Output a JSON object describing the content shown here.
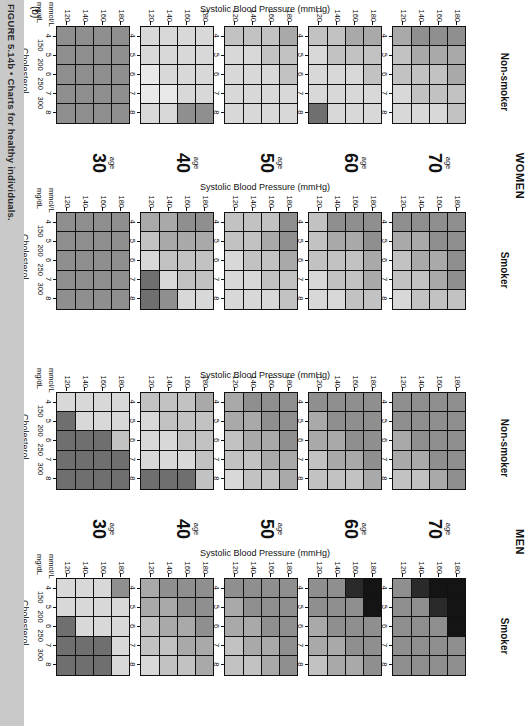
{
  "figure": {
    "caption": "FIGURE 5.14b • Charts for healthy individuals.",
    "panel_letter": "(b)",
    "caption_band_color": "#c9c9c9"
  },
  "axes": {
    "x_title": "Cholesterol",
    "y_title": "Systolic Blood Pressure (mmHg)",
    "bp_ticks": [
      "180",
      "160",
      "140",
      "120"
    ],
    "chol_mmol_ticks": [
      "4",
      "5",
      "6",
      "7",
      "8"
    ],
    "chol_mgdl_ticks": [
      "150",
      "200",
      "250",
      "300"
    ],
    "unit_mmol": "mmol/L",
    "unit_mgdl": "mg/dL"
  },
  "legend_palette": {
    "l1": "#e9e9e9",
    "l2": "#d8d8d8",
    "l3": "#c2c2c2",
    "l4": "#a9a9a9",
    "l5": "#8f8f8f",
    "l6": "#6f6f6f",
    "l7": "#4a4a4a",
    "l8": "#2a2a2a",
    "l9": "#141414"
  },
  "blocks": [
    {
      "id": "women",
      "title": "WOMEN",
      "columns": [
        {
          "id": "women-nonsmoker",
          "label": "Non-smoker"
        },
        {
          "id": "women-smoker",
          "label": "Smoker"
        }
      ],
      "ages": [
        "70",
        "60",
        "50",
        "40",
        "30"
      ],
      "age_word": "age"
    },
    {
      "id": "men",
      "title": "MEN",
      "columns": [
        {
          "id": "men-nonsmoker",
          "label": "Non-smoker"
        },
        {
          "id": "men-smoker",
          "label": "Smoker"
        }
      ],
      "ages": [
        "70",
        "60",
        "50",
        "40",
        "30"
      ],
      "age_word": "age"
    }
  ],
  "chart_data": {
    "type": "heatmap",
    "xlabel": "Cholesterol",
    "ylabel": "Systolic Blood Pressure (mmHg)",
    "x_categories_mmol": [
      "4",
      "5",
      "6",
      "7",
      "8"
    ],
    "x_categories_mgdl": [
      "150",
      "200",
      "250",
      "300"
    ],
    "y_categories": [
      "180",
      "160",
      "140",
      "120"
    ],
    "grid": true,
    "legend_position": "none",
    "note": "Each panel is a 4-row (systolic BP 180,160,140,120 top to bottom) x 5-column (cholesterol 4..8 mmol/L left to right) grid of greyscale risk cells. Values below are greyscale levels 1 (lightest / lowest risk) to 9 (darkest / highest risk) read off the printed shading.",
    "panels": [
      {
        "sex": "WOMEN",
        "smoking": "Non-smoker",
        "age": "70",
        "values": [
          [
            5,
            5,
            5,
            4
          ],
          [
            4,
            4,
            4,
            3
          ],
          [
            4,
            3,
            3,
            3
          ],
          [
            3,
            3,
            3,
            2
          ],
          [
            3,
            2,
            2,
            2
          ]
        ]
      },
      {
        "sex": "WOMEN",
        "smoking": "Non-smoker",
        "age": "60",
        "values": [
          [
            4,
            4,
            3,
            3
          ],
          [
            3,
            3,
            3,
            2
          ],
          [
            3,
            2,
            2,
            2
          ],
          [
            2,
            2,
            2,
            2
          ],
          [
            2,
            2,
            2,
            6
          ]
        ]
      },
      {
        "sex": "WOMEN",
        "smoking": "Non-smoker",
        "age": "50",
        "values": [
          [
            4,
            3,
            3,
            3
          ],
          [
            3,
            3,
            2,
            2
          ],
          [
            3,
            2,
            2,
            2
          ],
          [
            2,
            2,
            2,
            2
          ],
          [
            2,
            2,
            2,
            2
          ]
        ]
      },
      {
        "sex": "WOMEN",
        "smoking": "Non-smoker",
        "age": "40",
        "values": [
          [
            2,
            2,
            2,
            2
          ],
          [
            2,
            2,
            2,
            2
          ],
          [
            2,
            2,
            2,
            1
          ],
          [
            2,
            2,
            1,
            1
          ],
          [
            5,
            5,
            2,
            2
          ]
        ]
      },
      {
        "sex": "WOMEN",
        "smoking": "Non-smoker",
        "age": "30",
        "values": [
          [
            5,
            5,
            5,
            5
          ],
          [
            5,
            5,
            5,
            5
          ],
          [
            5,
            5,
            5,
            5
          ],
          [
            5,
            5,
            5,
            5
          ],
          [
            5,
            5,
            5,
            5
          ]
        ]
      },
      {
        "sex": "WOMEN",
        "smoking": "Smoker",
        "age": "70",
        "values": [
          [
            5,
            5,
            5,
            5
          ],
          [
            5,
            5,
            4,
            4
          ],
          [
            5,
            4,
            4,
            3
          ],
          [
            5,
            4,
            3,
            3
          ],
          [
            3,
            3,
            3,
            2
          ]
        ]
      },
      {
        "sex": "WOMEN",
        "smoking": "Smoker",
        "age": "60",
        "values": [
          [
            5,
            5,
            5,
            3
          ],
          [
            5,
            4,
            4,
            3
          ],
          [
            4,
            3,
            3,
            3
          ],
          [
            4,
            3,
            3,
            2
          ],
          [
            3,
            3,
            2,
            2
          ]
        ]
      },
      {
        "sex": "WOMEN",
        "smoking": "Smoker",
        "age": "50",
        "values": [
          [
            5,
            3,
            3,
            3
          ],
          [
            5,
            4,
            3,
            3
          ],
          [
            4,
            3,
            3,
            2
          ],
          [
            3,
            3,
            2,
            2
          ],
          [
            3,
            2,
            2,
            2
          ]
        ]
      },
      {
        "sex": "WOMEN",
        "smoking": "Smoker",
        "age": "40",
        "values": [
          [
            5,
            5,
            4,
            4
          ],
          [
            4,
            4,
            4,
            3
          ],
          [
            3,
            3,
            3,
            2
          ],
          [
            3,
            3,
            2,
            6
          ],
          [
            2,
            2,
            5,
            6
          ]
        ]
      },
      {
        "sex": "WOMEN",
        "smoking": "Smoker",
        "age": "30",
        "values": [
          [
            5,
            5,
            5,
            5
          ],
          [
            5,
            5,
            5,
            5
          ],
          [
            5,
            5,
            5,
            5
          ],
          [
            5,
            5,
            5,
            5
          ],
          [
            5,
            5,
            5,
            5
          ]
        ]
      },
      {
        "sex": "MEN",
        "smoking": "Non-smoker",
        "age": "70",
        "values": [
          [
            5,
            5,
            5,
            5
          ],
          [
            5,
            5,
            5,
            5
          ],
          [
            5,
            5,
            5,
            4
          ],
          [
            5,
            5,
            4,
            4
          ],
          [
            5,
            4,
            3,
            3
          ]
        ]
      },
      {
        "sex": "MEN",
        "smoking": "Non-smoker",
        "age": "60",
        "values": [
          [
            5,
            5,
            5,
            5
          ],
          [
            5,
            5,
            5,
            4
          ],
          [
            5,
            5,
            4,
            4
          ],
          [
            5,
            4,
            4,
            3
          ],
          [
            4,
            3,
            3,
            3
          ]
        ]
      },
      {
        "sex": "MEN",
        "smoking": "Non-smoker",
        "age": "50",
        "values": [
          [
            5,
            5,
            5,
            4
          ],
          [
            5,
            5,
            4,
            4
          ],
          [
            5,
            4,
            4,
            3
          ],
          [
            4,
            4,
            3,
            3
          ],
          [
            4,
            3,
            3,
            2
          ]
        ]
      },
      {
        "sex": "MEN",
        "smoking": "Non-smoker",
        "age": "40",
        "values": [
          [
            4,
            3,
            3,
            3
          ],
          [
            3,
            3,
            3,
            2
          ],
          [
            3,
            3,
            2,
            2
          ],
          [
            3,
            2,
            2,
            2
          ],
          [
            3,
            6,
            6,
            6
          ]
        ]
      },
      {
        "sex": "MEN",
        "smoking": "Non-smoker",
        "age": "30",
        "values": [
          [
            2,
            2,
            2,
            2
          ],
          [
            2,
            2,
            2,
            6
          ],
          [
            3,
            6,
            6,
            6
          ],
          [
            6,
            6,
            6,
            6
          ],
          [
            6,
            6,
            6,
            6
          ]
        ]
      },
      {
        "sex": "MEN",
        "smoking": "Smoker",
        "age": "70",
        "values": [
          [
            9,
            9,
            8,
            5
          ],
          [
            9,
            8,
            5,
            5
          ],
          [
            9,
            5,
            5,
            5
          ],
          [
            5,
            5,
            5,
            5
          ],
          [
            5,
            5,
            5,
            5
          ]
        ]
      },
      {
        "sex": "MEN",
        "smoking": "Smoker",
        "age": "60",
        "values": [
          [
            9,
            8,
            5,
            5
          ],
          [
            9,
            5,
            5,
            5
          ],
          [
            5,
            5,
            5,
            4
          ],
          [
            5,
            5,
            4,
            4
          ],
          [
            5,
            4,
            4,
            3
          ]
        ]
      },
      {
        "sex": "MEN",
        "smoking": "Smoker",
        "age": "50",
        "values": [
          [
            5,
            5,
            5,
            5
          ],
          [
            5,
            5,
            5,
            4
          ],
          [
            5,
            5,
            4,
            4
          ],
          [
            5,
            4,
            4,
            3
          ],
          [
            5,
            4,
            3,
            3
          ]
        ]
      },
      {
        "sex": "MEN",
        "smoking": "Smoker",
        "age": "40",
        "values": [
          [
            5,
            5,
            5,
            4
          ],
          [
            5,
            5,
            4,
            4
          ],
          [
            5,
            4,
            4,
            3
          ],
          [
            4,
            4,
            3,
            3
          ],
          [
            4,
            3,
            3,
            2
          ]
        ]
      },
      {
        "sex": "MEN",
        "smoking": "Smoker",
        "age": "30",
        "values": [
          [
            5,
            2,
            2,
            2
          ],
          [
            2,
            2,
            2,
            2
          ],
          [
            2,
            2,
            2,
            6
          ],
          [
            2,
            6,
            6,
            6
          ],
          [
            2,
            6,
            6,
            6
          ]
        ]
      }
    ]
  }
}
